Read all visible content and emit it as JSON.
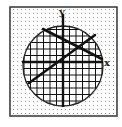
{
  "diagram": {
    "frame": {
      "x": 10,
      "y": 7,
      "w": 107,
      "h": 109,
      "stroke": "#333333",
      "dot_color": "#9a9a9a",
      "dot_spacing": 4
    },
    "circle": {
      "cx": 63,
      "cy": 66,
      "r": 40,
      "stroke": "#222222",
      "grid_spacing": 6.5,
      "grid_color": "#111111"
    },
    "axes": {
      "y_axis": {
        "x": 63,
        "y1": 14,
        "y2": 107,
        "label": "y",
        "label_x": 59,
        "label_y": 15
      },
      "x_axis": {
        "y": 62,
        "x1": 22,
        "x2": 103,
        "label": "x",
        "label_x": 104,
        "label_y": 66
      }
    },
    "lines": [
      {
        "name": "line-1",
        "x1": 43,
        "y1": 29,
        "x2": 102,
        "y2": 59
      },
      {
        "name": "line-2",
        "x1": 29,
        "y1": 83,
        "x2": 95,
        "y2": 35
      }
    ],
    "line_color": "#111111",
    "axis_color": "#111111"
  }
}
